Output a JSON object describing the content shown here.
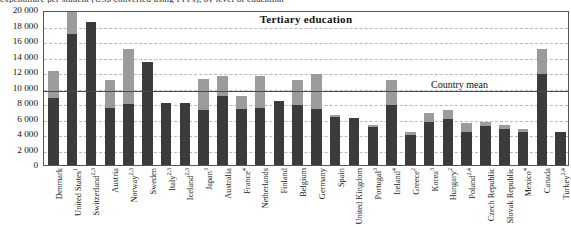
{
  "header": {
    "clipped_line": "expenditure per student (US$ converted using PPPs), by level of education"
  },
  "chart_data": {
    "type": "bar",
    "title": "Tertiary education",
    "xlabel": "",
    "ylabel": "",
    "ylim": [
      0,
      20000
    ],
    "ytick_labels": [
      "20 000",
      "18 000",
      "16 000",
      "14 000",
      "12 000",
      "10 000",
      "8 000",
      "6 000",
      "4 000",
      "2 000",
      "0"
    ],
    "ytick_values": [
      20000,
      18000,
      16000,
      14000,
      12000,
      10000,
      8000,
      6000,
      4000,
      2000,
      0
    ],
    "grid": true,
    "stacked": true,
    "legend_position": "none",
    "annotations": [
      {
        "name": "country-mean",
        "label": "Country mean",
        "value": 9800,
        "type": "hline"
      }
    ],
    "categories": [
      "Denmark",
      "United States",
      "Switzerland",
      "Austria",
      "Norway",
      "Sweden",
      "Italy",
      "Iceland",
      "Japan",
      "Australia",
      "France",
      "Netherlands",
      "Finland",
      "Belgium",
      "Germany",
      "Spain",
      "United Kingdom",
      "Portugal",
      "Ireland",
      "Greece",
      "Korea",
      "Hungary",
      "Poland",
      "Czech Republic",
      "Slovak Republic",
      "Mexico",
      "Canada",
      "Turkey"
    ],
    "category_notes": [
      "",
      "1",
      "2,3",
      "",
      "2,3",
      "",
      "2,3",
      "2,3",
      "3",
      "",
      "4",
      "",
      "",
      "",
      "",
      "",
      "",
      "3",
      "4",
      "2",
      "3",
      "2",
      "2,4",
      "",
      "",
      "4",
      "",
      "2,4"
    ],
    "series": [
      {
        "name": "lower-segment",
        "color": "#3b3b3b",
        "values": [
          8600,
          16900,
          18400,
          7300,
          7900,
          13300,
          8050,
          8050,
          7100,
          8850,
          7200,
          7300,
          8300,
          7700,
          7250,
          6200,
          6100,
          4900,
          7700,
          3850,
          5600,
          5900,
          4300,
          5000,
          4700,
          4300,
          11800,
          4250
        ]
      },
      {
        "name": "upper-segment",
        "color": "#9b9b9b",
        "values": [
          3500,
          3100,
          0,
          3650,
          7100,
          0,
          0,
          0,
          4000,
          2650,
          1750,
          4200,
          0,
          3300,
          4550,
          250,
          0,
          250,
          3300,
          450,
          1100,
          1150,
          1100,
          550,
          500,
          400,
          3200,
          0
        ]
      }
    ],
    "totals": [
      12100,
      20000,
      18400,
      10950,
      15000,
      13300,
      8050,
      8050,
      11100,
      11500,
      8950,
      11500,
      8300,
      11000,
      11800,
      6450,
      6100,
      5150,
      11000,
      4300,
      6700,
      7050,
      5400,
      5550,
      5200,
      4700,
      15000,
      4250
    ]
  }
}
